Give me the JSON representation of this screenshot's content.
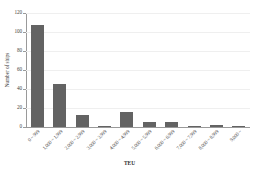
{
  "chart_data": {
    "type": "bar",
    "title": "",
    "subtitle": "",
    "xlabel": "TEU",
    "ylabel": "Number of ships",
    "categories": [
      "0 ~ 999",
      "1,000 ~ 1,999",
      "2,000 ~ 2,999",
      "3,000 ~ 3,999",
      "4,000 ~ 4,999",
      "5,000 ~ 5,999",
      "6,000 ~ 6,999",
      "7,000 ~ 7,999",
      "8,000 ~ 8,999",
      "9,000 ~"
    ],
    "values": [
      107,
      45,
      13,
      1,
      16,
      5,
      5,
      1,
      2,
      1
    ],
    "ylim": [
      0,
      120
    ],
    "yticks": [
      0,
      20,
      40,
      60,
      80,
      100,
      120
    ],
    "ytick_labels": [
      "0",
      "20",
      "40",
      "60",
      "80",
      "100",
      "120"
    ],
    "grid": true,
    "grid_axis": "y",
    "legend": false,
    "legend_position": "none",
    "bar_color": "#636363",
    "axis_color": "#9a9a9a",
    "grid_color": "#efefef",
    "background_color": "#ffffff",
    "text_color": "#3f3f3f"
  }
}
